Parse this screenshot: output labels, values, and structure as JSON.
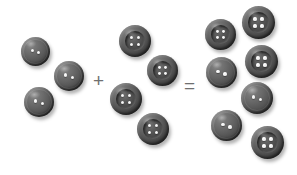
{
  "scene": {
    "width": 297,
    "height": 175,
    "background": "#ffffff",
    "description": "Addition equation illustrated with sewing buttons"
  },
  "equation": {
    "left_count": 3,
    "right_count": 4,
    "sum_count": 7,
    "plus_symbol": "+",
    "equals_symbol": "=",
    "expression": "3 + 4 = 7"
  },
  "colors": {
    "button_light": "#8e8e8e",
    "button_mid": "#636363",
    "button_dark": "#2e2e2e",
    "hole": "#ffffff",
    "operator": "#6f6f6f",
    "background": "#ffffff"
  },
  "groups": [
    {
      "name": "addend-one",
      "label": "3",
      "buttons": [
        {
          "holes": 2,
          "x": 21,
          "y": 37,
          "size": 29
        },
        {
          "holes": 2,
          "x": 54,
          "y": 61,
          "size": 30
        },
        {
          "holes": 2,
          "x": 24,
          "y": 87,
          "size": 30
        }
      ]
    },
    {
      "name": "addend-two",
      "label": "4",
      "buttons": [
        {
          "holes": 4,
          "x": 119,
          "y": 25,
          "size": 32
        },
        {
          "holes": 4,
          "x": 147,
          "y": 55,
          "size": 31
        },
        {
          "holes": 4,
          "x": 110,
          "y": 83,
          "size": 32
        },
        {
          "holes": 4,
          "x": 137,
          "y": 113,
          "size": 32
        }
      ]
    },
    {
      "name": "sum",
      "label": "7",
      "buttons": [
        {
          "holes": 4,
          "x": 205,
          "y": 19,
          "size": 31
        },
        {
          "holes": 4,
          "x": 242,
          "y": 6,
          "size": 33
        },
        {
          "holes": 2,
          "x": 206,
          "y": 57,
          "size": 31
        },
        {
          "holes": 4,
          "x": 245,
          "y": 45,
          "size": 33
        },
        {
          "holes": 2,
          "x": 241,
          "y": 82,
          "size": 32
        },
        {
          "holes": 2,
          "x": 211,
          "y": 110,
          "size": 31
        },
        {
          "holes": 4,
          "x": 251,
          "y": 126,
          "size": 33
        }
      ]
    }
  ],
  "operators": [
    {
      "name": "plus-operator",
      "symbol": "+",
      "x": 93,
      "y": 71
    },
    {
      "name": "equals-operator",
      "symbol": "=",
      "x": 184,
      "y": 76
    }
  ]
}
